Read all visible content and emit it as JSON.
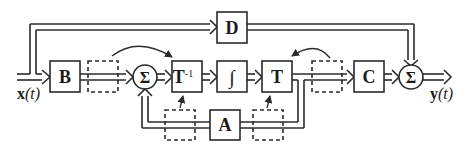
{
  "diagram": {
    "type": "state-space block diagram with similarity transformation",
    "colors": {
      "line": "#2a2a2a",
      "background": "#ffffff"
    },
    "input": {
      "label": "x",
      "arg": "(t)"
    },
    "output": {
      "label": "y",
      "arg": "(t)"
    },
    "blocks": {
      "B": "B",
      "D": "D",
      "Tinv": "T",
      "Tinv_sup": "-1",
      "integrator": "∫",
      "T": "T",
      "C": "C",
      "A": "A"
    },
    "summing_junctions": [
      {
        "id": "sum1",
        "symbol": "Σ"
      },
      {
        "id": "sum2",
        "symbol": "Σ"
      }
    ],
    "dashed_boxes": 4,
    "curved_arrows": 2
  }
}
